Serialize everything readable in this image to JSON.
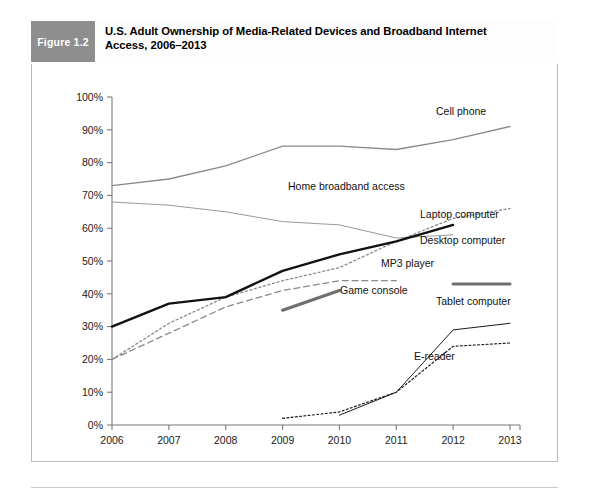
{
  "figure": {
    "badge_label": "Figure 1.2",
    "title_line1": "U.S. Adult Ownership of Media-Related Devices and Broadband Internet",
    "title_line2": "Access, 2006–2013",
    "badge_color": "#8e8e8e",
    "frame_color": "#b9b9b9"
  },
  "chart_data": {
    "type": "line",
    "title": "U.S. Adult Ownership of Media-Related Devices and Broadband Internet Access, 2006–2013",
    "xlabel": "",
    "ylabel": "",
    "x": [
      2006,
      2007,
      2008,
      2009,
      2010,
      2011,
      2012,
      2013
    ],
    "xtick_labels": [
      "2006",
      "2007",
      "2008",
      "2009",
      "2010",
      "2011",
      "2012",
      "2013"
    ],
    "ylim": [
      0,
      100
    ],
    "ytick_labels": [
      "0%",
      "10%",
      "20%",
      "30%",
      "40%",
      "50%",
      "60%",
      "70%",
      "80%",
      "90%",
      "100%"
    ],
    "ytick_values": [
      0,
      10,
      20,
      30,
      40,
      50,
      60,
      70,
      80,
      90,
      100
    ],
    "grid": false,
    "legend": "inline-labels",
    "series": [
      {
        "name": "Cell phone",
        "x": [
          2006,
          2007,
          2008,
          2009,
          2010,
          2011,
          2012,
          2013
        ],
        "values": [
          73,
          75,
          79,
          85,
          85,
          84,
          87,
          91
        ],
        "color": "#8a8a8a",
        "style": "solid",
        "width": 1.3,
        "label_x": 436,
        "label_y": 115
      },
      {
        "name": "Desktop computer",
        "x": [
          2006,
          2007,
          2008,
          2009,
          2010,
          2011,
          2012
        ],
        "values": [
          68,
          67,
          65,
          62,
          61,
          57,
          58
        ],
        "color": "#9a9a9a",
        "style": "solid",
        "width": 1.0,
        "label_x": 420,
        "label_y": 244
      },
      {
        "name": "Home broadband access",
        "x": [
          2006,
          2007,
          2008,
          2009,
          2010,
          2011,
          2012,
          2013
        ],
        "values": [
          20,
          31,
          39,
          44,
          48,
          56,
          63,
          66
        ],
        "color": "#8a8a8a",
        "style": "dotted",
        "width": 1.3,
        "label_x": 288,
        "label_y": 190
      },
      {
        "name": "Laptop computer",
        "x": [
          2006,
          2007,
          2008,
          2009,
          2010,
          2011,
          2012
        ],
        "values": [
          30,
          37,
          39,
          47,
          52,
          56,
          61
        ],
        "color": "#111111",
        "style": "solid",
        "width": 2.4,
        "label_x": 420,
        "label_y": 218
      },
      {
        "name": "MP3 player",
        "x": [
          2006,
          2007,
          2008,
          2009,
          2010,
          2011
        ],
        "values": [
          20,
          28,
          36,
          41,
          44,
          44
        ],
        "color": "#8a8a8a",
        "style": "dashed",
        "width": 1.3,
        "label_x": 381,
        "label_y": 267
      },
      {
        "name": "Game console",
        "x": [
          2009,
          2010
        ],
        "values": [
          35,
          41
        ],
        "color": "#6f6f6f",
        "style": "thick-segment",
        "width": 3.2,
        "label_x": 340,
        "label_y": 294,
        "extra_segment_x": [
          2012,
          2013
        ],
        "extra_segment_values": [
          43,
          43
        ]
      },
      {
        "name": "Tablet computer",
        "x": [
          2010,
          2011,
          2012,
          2013
        ],
        "values": [
          3,
          10,
          29,
          31
        ],
        "color": "#1a1a1a",
        "style": "solid",
        "width": 1.0,
        "label_x": 436,
        "label_y": 305
      },
      {
        "name": "E-reader",
        "x": [
          2009,
          2010,
          2011,
          2012,
          2013
        ],
        "values": [
          2,
          4,
          10,
          24,
          25
        ],
        "color": "#1a1a1a",
        "style": "dotted",
        "width": 1.2,
        "label_x": 414,
        "label_y": 360
      }
    ]
  }
}
